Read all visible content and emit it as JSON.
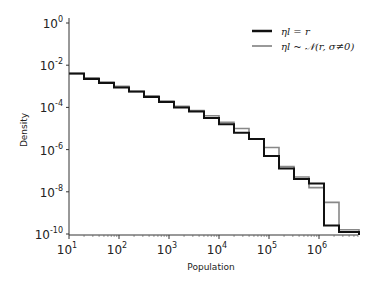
{
  "chart_data": {
    "type": "line",
    "subtype": "step-histogram",
    "title": "",
    "xlabel": "Population",
    "ylabel": "Density",
    "xscale": "log",
    "yscale": "log",
    "xlim": [
      10,
      6500000
    ],
    "ylim": [
      1e-10,
      1
    ],
    "xticks": [
      "10^1",
      "10^2",
      "10^3",
      "10^4",
      "10^5",
      "10^6"
    ],
    "yticks": [
      "10^0",
      "10^-2",
      "10^-4",
      "10^-6",
      "10^-8",
      "10^-10"
    ],
    "grid": false,
    "legend_position": "upper right",
    "bin_edges_log10": [
      1.0,
      1.3,
      1.6,
      1.9,
      2.2,
      2.5,
      2.8,
      3.1,
      3.4,
      3.7,
      4.0,
      4.3,
      4.6,
      4.9,
      5.2,
      5.5,
      5.8,
      6.1,
      6.4,
      6.8
    ],
    "series": [
      {
        "name": "η_l = r",
        "color": "#111111",
        "log10_density": [
          -2.4,
          -2.65,
          -2.85,
          -3.05,
          -3.25,
          -3.5,
          -3.75,
          -4.0,
          -4.2,
          -4.5,
          -4.8,
          -5.2,
          -5.5,
          -6.3,
          -6.9,
          -7.4,
          -7.6,
          -9.6,
          -9.9
        ]
      },
      {
        "name": "η_l ~ N(r, σ≠0)",
        "color": "#888888",
        "log10_density": [
          -2.4,
          -2.6,
          -2.8,
          -3.0,
          -3.25,
          -3.45,
          -3.7,
          -3.95,
          -4.15,
          -4.4,
          -4.7,
          -5.0,
          -5.5,
          -5.9,
          -6.8,
          -7.3,
          -7.8,
          -8.5,
          -9.8
        ]
      }
    ]
  },
  "legend": {
    "items": [
      {
        "label": "ηl = r",
        "color": "#111111"
      },
      {
        "label": "ηl ~ 𝒩(r, σ≠0)",
        "color": "#999999"
      }
    ]
  },
  "axes": {
    "xlabel": "Population",
    "ylabel": "Density",
    "x_tick_bases": [
      "10",
      "10",
      "10",
      "10",
      "10",
      "10"
    ],
    "x_tick_exps": [
      "1",
      "2",
      "3",
      "4",
      "5",
      "6"
    ],
    "y_tick_bases": [
      "10",
      "10",
      "10",
      "10",
      "10",
      "10"
    ],
    "y_tick_exps": [
      "0",
      "-2",
      "-4",
      "-6",
      "-8",
      "-10"
    ]
  }
}
